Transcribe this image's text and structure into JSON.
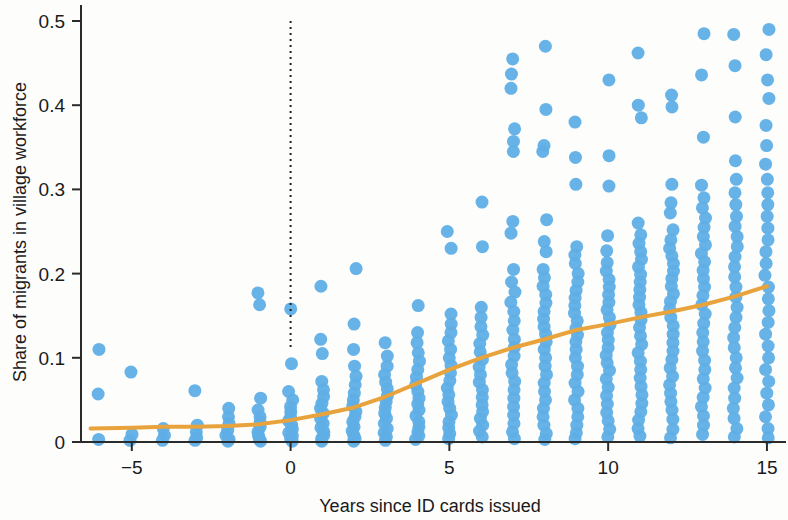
{
  "chart_data": {
    "type": "scatter",
    "title": "",
    "subtitle": "",
    "xlabel": "Years since ID cards issued",
    "ylabel": "Share of migrants in village workforce",
    "xlim": [
      -6.6,
      15.6
    ],
    "ylim": [
      0,
      0.5
    ],
    "xticks": [
      -5,
      0,
      5,
      10,
      15
    ],
    "xtick_labels": [
      "−5",
      "0",
      "5",
      "10",
      "15"
    ],
    "yticks": [
      0,
      0.1,
      0.2,
      0.3,
      0.4,
      0.5
    ],
    "ytick_labels": [
      "0",
      "0.1",
      "0.2",
      "0.3",
      "0.4",
      "0.5"
    ],
    "grid": false,
    "legend": null,
    "point_color": "#5fafe6",
    "point_opacity": 0.95,
    "point_radius": 6.5,
    "annotations": [
      {
        "name": "treatment-line",
        "type": "vline",
        "x": 0,
        "y_from": 0.11,
        "y_to": 0.5,
        "style": "dotted",
        "color": "#222222"
      }
    ],
    "series": [
      {
        "name": "Villages",
        "type": "scatter",
        "color": "#5fafe6",
        "columns": [
          {
            "x": -6,
            "values": [
              0.11,
              0.057,
              0.003
            ]
          },
          {
            "x": -5,
            "values": [
              0.083,
              0.009,
              0.002
            ]
          },
          {
            "x": -4,
            "values": [
              0.016,
              0.008,
              0.002
            ]
          },
          {
            "x": -3,
            "values": [
              0.061,
              0.02,
              0.012,
              0.005,
              0.002
            ]
          },
          {
            "x": -2,
            "values": [
              0.04,
              0.03,
              0.022,
              0.014,
              0.008,
              0.003,
              0.001
            ]
          },
          {
            "x": -1,
            "values": [
              0.177,
              0.163,
              0.052,
              0.038,
              0.03,
              0.024,
              0.018,
              0.012,
              0.007,
              0.003,
              0.001
            ]
          },
          {
            "x": 0,
            "values": [
              0.158,
              0.093,
              0.06,
              0.05,
              0.042,
              0.036,
              0.03,
              0.025,
              0.02,
              0.015,
              0.011,
              0.007,
              0.004,
              0.001
            ]
          },
          {
            "x": 1,
            "values": [
              0.185,
              0.122,
              0.105,
              0.072,
              0.062,
              0.054,
              0.046,
              0.04,
              0.034,
              0.028,
              0.022,
              0.017,
              0.012,
              0.008,
              0.004,
              0.001
            ]
          },
          {
            "x": 2,
            "values": [
              0.206,
              0.14,
              0.11,
              0.09,
              0.078,
              0.068,
              0.058,
              0.05,
              0.043,
              0.036,
              0.03,
              0.024,
              0.018,
              0.013,
              0.008,
              0.004,
              0.001
            ]
          },
          {
            "x": 3,
            "values": [
              0.118,
              0.102,
              0.09,
              0.08,
              0.071,
              0.063,
              0.055,
              0.048,
              0.041,
              0.034,
              0.028,
              0.022,
              0.016,
              0.011,
              0.006,
              0.002
            ]
          },
          {
            "x": 4,
            "values": [
              0.162,
              0.13,
              0.118,
              0.106,
              0.096,
              0.086,
              0.077,
              0.068,
              0.06,
              0.052,
              0.045,
              0.038,
              0.031,
              0.024,
              0.018,
              0.012,
              0.007,
              0.003
            ]
          },
          {
            "x": 5,
            "values": [
              0.25,
              0.23,
              0.152,
              0.14,
              0.13,
              0.12,
              0.11,
              0.1,
              0.091,
              0.082,
              0.073,
              0.064,
              0.056,
              0.048,
              0.04,
              0.032,
              0.024,
              0.017,
              0.01,
              0.004
            ]
          },
          {
            "x": 6,
            "values": [
              0.285,
              0.232,
              0.16,
              0.148,
              0.137,
              0.127,
              0.117,
              0.107,
              0.098,
              0.089,
              0.08,
              0.071,
              0.062,
              0.053,
              0.044,
              0.036,
              0.028,
              0.02,
              0.013,
              0.006
            ]
          },
          {
            "x": 7,
            "values": [
              0.455,
              0.437,
              0.42,
              0.372,
              0.357,
              0.345,
              0.262,
              0.248,
              0.205,
              0.19,
              0.178,
              0.166,
              0.155,
              0.144,
              0.133,
              0.122,
              0.112,
              0.102,
              0.092,
              0.082,
              0.072,
              0.062,
              0.052,
              0.042,
              0.032,
              0.022,
              0.012,
              0.004
            ]
          },
          {
            "x": 8,
            "values": [
              0.47,
              0.395,
              0.352,
              0.345,
              0.264,
              0.238,
              0.226,
              0.205,
              0.195,
              0.185,
              0.175,
              0.165,
              0.155,
              0.146,
              0.137,
              0.128,
              0.119,
              0.11,
              0.1,
              0.09,
              0.08,
              0.07,
              0.06,
              0.05,
              0.04,
              0.03,
              0.02,
              0.01,
              0.003
            ]
          },
          {
            "x": 9,
            "values": [
              0.38,
              0.338,
              0.306,
              0.232,
              0.222,
              0.212,
              0.2,
              0.19,
              0.18,
              0.171,
              0.162,
              0.153,
              0.144,
              0.135,
              0.127,
              0.119,
              0.11,
              0.1,
              0.09,
              0.08,
              0.07,
              0.06,
              0.05,
              0.04,
              0.03,
              0.02,
              0.011,
              0.004
            ]
          },
          {
            "x": 10,
            "values": [
              0.43,
              0.34,
              0.304,
              0.245,
              0.227,
              0.213,
              0.203,
              0.193,
              0.184,
              0.175,
              0.166,
              0.157,
              0.148,
              0.139,
              0.13,
              0.121,
              0.112,
              0.103,
              0.094,
              0.085,
              0.075,
              0.065,
              0.055,
              0.045,
              0.035,
              0.025,
              0.015,
              0.006
            ]
          },
          {
            "x": 11,
            "values": [
              0.462,
              0.4,
              0.385,
              0.26,
              0.246,
              0.236,
              0.226,
              0.217,
              0.208,
              0.199,
              0.19,
              0.181,
              0.172,
              0.163,
              0.154,
              0.145,
              0.136,
              0.126,
              0.116,
              0.106,
              0.096,
              0.086,
              0.076,
              0.066,
              0.056,
              0.046,
              0.036,
              0.026,
              0.016,
              0.007
            ]
          },
          {
            "x": 12,
            "values": [
              0.412,
              0.398,
              0.306,
              0.284,
              0.272,
              0.252,
              0.24,
              0.23,
              0.221,
              0.212,
              0.203,
              0.194,
              0.185,
              0.176,
              0.167,
              0.158,
              0.148,
              0.138,
              0.128,
              0.118,
              0.108,
              0.098,
              0.088,
              0.078,
              0.068,
              0.058,
              0.048,
              0.038,
              0.027,
              0.015,
              0.005
            ]
          },
          {
            "x": 13,
            "values": [
              0.485,
              0.436,
              0.362,
              0.305,
              0.29,
              0.278,
              0.266,
              0.255,
              0.244,
              0.234,
              0.224,
              0.214,
              0.204,
              0.194,
              0.184,
              0.174,
              0.163,
              0.152,
              0.141,
              0.13,
              0.119,
              0.108,
              0.097,
              0.086,
              0.075,
              0.064,
              0.053,
              0.042,
              0.031,
              0.02,
              0.009
            ]
          },
          {
            "x": 14,
            "values": [
              0.484,
              0.447,
              0.386,
              0.334,
              0.312,
              0.296,
              0.282,
              0.268,
              0.256,
              0.244,
              0.232,
              0.22,
              0.208,
              0.196,
              0.184,
              0.172,
              0.16,
              0.148,
              0.136,
              0.124,
              0.112,
              0.1,
              0.088,
              0.076,
              0.064,
              0.052,
              0.04,
              0.028,
              0.016,
              0.006
            ]
          },
          {
            "x": 15,
            "values": [
              0.49,
              0.46,
              0.43,
              0.408,
              0.376,
              0.352,
              0.33,
              0.312,
              0.296,
              0.282,
              0.268,
              0.254,
              0.24,
              0.226,
              0.212,
              0.198,
              0.184,
              0.17,
              0.156,
              0.142,
              0.128,
              0.114,
              0.1,
              0.086,
              0.072,
              0.058,
              0.044,
              0.03,
              0.016,
              0.005
            ]
          }
        ]
      },
      {
        "name": "Smoothed trend",
        "type": "line",
        "color": "#e8a33d",
        "width": 4,
        "points": [
          {
            "x": -6.3,
            "y": 0.016
          },
          {
            "x": -5,
            "y": 0.017
          },
          {
            "x": -4,
            "y": 0.018
          },
          {
            "x": -3,
            "y": 0.018
          },
          {
            "x": -2,
            "y": 0.019
          },
          {
            "x": -1,
            "y": 0.021
          },
          {
            "x": 0,
            "y": 0.026
          },
          {
            "x": 1,
            "y": 0.033
          },
          {
            "x": 2,
            "y": 0.041
          },
          {
            "x": 3,
            "y": 0.054
          },
          {
            "x": 4,
            "y": 0.07
          },
          {
            "x": 5,
            "y": 0.086
          },
          {
            "x": 6,
            "y": 0.1
          },
          {
            "x": 7,
            "y": 0.112
          },
          {
            "x": 8,
            "y": 0.122
          },
          {
            "x": 9,
            "y": 0.133
          },
          {
            "x": 10,
            "y": 0.14
          },
          {
            "x": 11,
            "y": 0.148
          },
          {
            "x": 12,
            "y": 0.155
          },
          {
            "x": 13,
            "y": 0.163
          },
          {
            "x": 14,
            "y": 0.173
          },
          {
            "x": 15,
            "y": 0.185
          }
        ]
      }
    ]
  }
}
